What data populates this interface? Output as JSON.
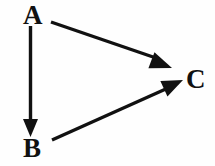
{
  "diagram": {
    "type": "directed-graph",
    "background_color": "#fefefe",
    "stroke_color": "#111111",
    "nodes": [
      {
        "id": "A",
        "label": "A",
        "x": 33,
        "y": 16,
        "role": "source"
      },
      {
        "id": "B",
        "label": "B",
        "x": 33,
        "y": 149,
        "role": "intermediate"
      },
      {
        "id": "C",
        "label": "C",
        "x": 196,
        "y": 79,
        "role": "sink"
      }
    ],
    "edges": [
      {
        "id": "edge-a-b",
        "from": "A",
        "to": "B",
        "label": "",
        "directed": true,
        "shaft": {
          "x1": 30.5,
          "y1": 26,
          "x2": 30.5,
          "y2": 122
        },
        "arrowhead": {
          "tip_x": 30.5,
          "tip_y": 137,
          "width": 15,
          "length": 18
        }
      },
      {
        "id": "edge-a-c",
        "from": "A",
        "to": "C",
        "label": "",
        "directed": true,
        "shaft": {
          "x1": 51,
          "y1": 22,
          "x2": 156,
          "y2": 58
        },
        "arrowhead": {
          "tip_x": 172,
          "tip_y": 68,
          "width": 17,
          "length": 22
        }
      },
      {
        "id": "edge-b-c",
        "from": "B",
        "to": "C",
        "label": "",
        "directed": true,
        "shaft": {
          "x1": 52,
          "y1": 140,
          "x2": 168,
          "y2": 88
        },
        "arrowhead": {
          "tip_x": 183,
          "tip_y": 80,
          "width": 17,
          "length": 21
        }
      }
    ]
  }
}
